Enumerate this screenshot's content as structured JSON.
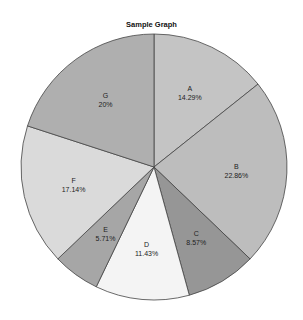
{
  "chart_data": {
    "type": "pie",
    "title": "Sample Graph",
    "categories": [
      "A",
      "B",
      "C",
      "D",
      "E",
      "F",
      "G"
    ],
    "values": [
      14.29,
      22.86,
      8.57,
      11.43,
      5.71,
      17.14,
      20
    ],
    "labels": [
      "14.29%",
      "22.86%",
      "8.57%",
      "11.43%",
      "5.71%",
      "17.14%",
      "20%"
    ],
    "colors": [
      "#c4c4c4",
      "#bdbdbd",
      "#969696",
      "#f4f4f4",
      "#a6a6a6",
      "#dadada",
      "#afafaf"
    ],
    "start_angle": "12 o'clock",
    "direction": "clockwise",
    "legend": "none"
  }
}
